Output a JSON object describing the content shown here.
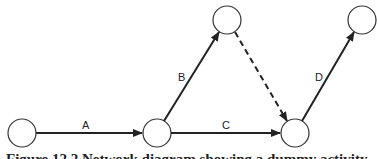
{
  "diagram": {
    "type": "activity-on-arrow network",
    "nodes": [
      {
        "id": "n1",
        "cx": 22,
        "cy": 133
      },
      {
        "id": "n2",
        "cx": 157,
        "cy": 133
      },
      {
        "id": "n3",
        "cx": 227,
        "cy": 20
      },
      {
        "id": "n4",
        "cx": 295,
        "cy": 133
      },
      {
        "id": "n5",
        "cx": 362,
        "cy": 20
      }
    ],
    "edges": [
      {
        "from": "n1",
        "to": "n2",
        "label": "A",
        "style": "solid"
      },
      {
        "from": "n2",
        "to": "n3",
        "label": "B",
        "style": "solid"
      },
      {
        "from": "n2",
        "to": "n4",
        "label": "C",
        "style": "solid"
      },
      {
        "from": "n3",
        "to": "n4",
        "label": "",
        "style": "dashed"
      },
      {
        "from": "n4",
        "to": "n5",
        "label": "D",
        "style": "solid"
      }
    ],
    "labels": {
      "a": "A",
      "b": "B",
      "c": "C",
      "d": "D"
    }
  },
  "caption": "Figure 12.2 Network diagram showing a dummy activity"
}
